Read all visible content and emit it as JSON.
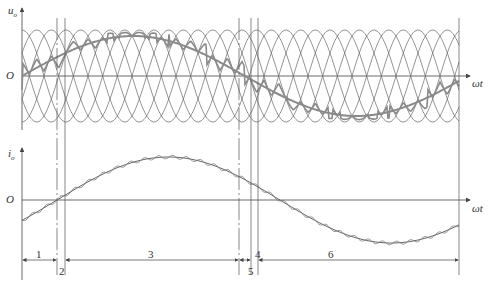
{
  "top_plot": {
    "y_label": "u_o",
    "y_label_main": "u",
    "y_label_sub": "o",
    "origin_label": "O",
    "x_label": "ωt"
  },
  "bottom_plot": {
    "y_label_main": "i",
    "y_label_sub": "o",
    "origin_label": "O",
    "x_label": "ωt"
  },
  "intervals": [
    {
      "id": "1",
      "label": "1"
    },
    {
      "id": "2",
      "label": "2"
    },
    {
      "id": "3",
      "label": "3"
    },
    {
      "id": "4",
      "label": "4"
    },
    {
      "id": "5",
      "label": "5"
    },
    {
      "id": "6",
      "label": "6"
    }
  ],
  "colors": {
    "line": "#555555",
    "heavy": "#8a8a8a",
    "axis": "#444444"
  }
}
